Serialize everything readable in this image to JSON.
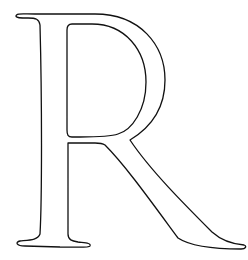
{
  "figure": {
    "letter": "R",
    "style": "serif capital letter outline drawing",
    "stroke_color": "#111111",
    "background_color": "#ffffff"
  }
}
